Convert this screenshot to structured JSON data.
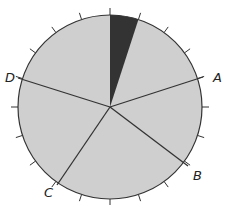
{
  "diagram": {
    "type": "circle-with-sectors",
    "center": [
      110,
      107
    ],
    "radius": 92,
    "fill_color": "#cfcfcf",
    "stroke_color": "#333333",
    "shaded_sector": {
      "start_deg": 0,
      "end_deg": 18,
      "color": "#333333"
    },
    "tick_count": 20,
    "radial_lines": [
      {
        "label": "A",
        "end": [
          203,
          77
        ],
        "label_pos": [
          213,
          82
        ]
      },
      {
        "label": "B",
        "end": [
          188,
          166
        ],
        "label_pos": [
          193,
          180
        ]
      },
      {
        "label": "C",
        "end": [
          57,
          185
        ],
        "label_pos": [
          44,
          197
        ]
      },
      {
        "label": "D",
        "end": [
          18,
          78
        ],
        "label_pos": [
          5,
          82
        ]
      }
    ]
  }
}
